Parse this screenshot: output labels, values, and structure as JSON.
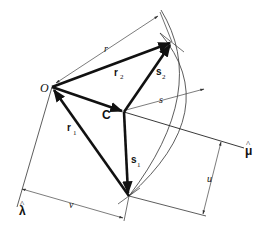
{
  "diagram": {
    "points": {
      "origin": {
        "label": "O",
        "x": 52,
        "y": 87
      },
      "center": {
        "label": "C",
        "x": 124,
        "y": 112
      },
      "top": {
        "x": 172,
        "y": 42
      },
      "bottom": {
        "x": 129,
        "y": 196
      }
    },
    "vectors": [
      {
        "label": "r",
        "subscript": "1",
        "from": "bottom",
        "to": "origin"
      },
      {
        "label": "r",
        "subscript": "2",
        "from": "origin",
        "to": "top"
      },
      {
        "label": "s",
        "subscript": "1",
        "from": "center",
        "to": "bottom"
      },
      {
        "label": "s",
        "subscript": "2",
        "from": "center",
        "to": "top"
      },
      {
        "label": "",
        "subscript": "",
        "from": "origin",
        "to": "center"
      }
    ],
    "axes": {
      "lambda_hat": {
        "label": "λ̂"
      },
      "mu_hat": {
        "label": "μ̂"
      }
    },
    "dimensions": {
      "r": "r",
      "s": "s",
      "u": "u",
      "v": "v"
    },
    "labels": {
      "O": "O",
      "C": "C",
      "r1": "r",
      "r1_sub": "1",
      "r2": "r",
      "r2_sub": "2",
      "s1": "s",
      "s1_sub": "1",
      "s2": "s",
      "s2_sub": "2",
      "lambda": "λ",
      "mu": "μ",
      "hat": "^"
    },
    "colors": {
      "ink": "#111111",
      "thin": "#444444",
      "background": "#ffffff"
    }
  }
}
